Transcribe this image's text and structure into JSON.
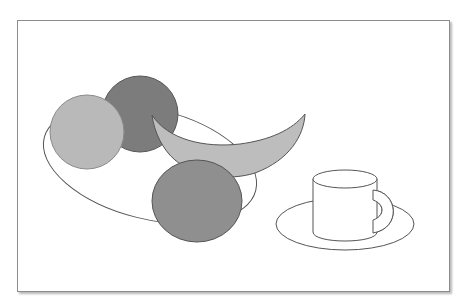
{
  "illustration": {
    "title": "Still life: fruit bowl with cup and saucer",
    "frame": {
      "x": 17,
      "y": 20,
      "width": 431,
      "height": 270,
      "border_color": "#8c8c8c"
    },
    "objects": [
      {
        "id": "plate",
        "label": "plate",
        "shape": "ellipse",
        "cx": 150,
        "cy": 164,
        "rx": 109,
        "ry": 57,
        "rotate": 14,
        "fill": "#ffffff",
        "stroke": "#555555"
      },
      {
        "id": "fruit-dark",
        "label": "dark fruit",
        "shape": "circle",
        "cx": 140,
        "cy": 114,
        "r": 38,
        "fill": "#7c7c7c",
        "stroke": "#555555"
      },
      {
        "id": "fruit-light",
        "label": "light orange",
        "shape": "circle",
        "cx": 87,
        "cy": 132,
        "r": 37,
        "fill": "#b9b9b9",
        "stroke": "#777777"
      },
      {
        "id": "banana",
        "label": "banana",
        "shape": "path",
        "fill": "#bdbdbd",
        "stroke": "#555555"
      },
      {
        "id": "fruit-mid",
        "label": "orange",
        "shape": "circle",
        "cx": 197,
        "cy": 201,
        "rx": 45,
        "ry": 41,
        "fill": "#8f8f8f",
        "stroke": "#555555"
      },
      {
        "id": "saucer",
        "label": "saucer",
        "shape": "ellipse",
        "cx": 345,
        "cy": 224,
        "rx": 69,
        "ry": 26,
        "fill": "#ffffff",
        "stroke": "#555555"
      },
      {
        "id": "cup",
        "label": "cup",
        "shape": "cylinder",
        "x": 313,
        "y": 179,
        "width": 64,
        "height": 61,
        "fill": "#ffffff",
        "stroke": "#555555"
      }
    ]
  }
}
